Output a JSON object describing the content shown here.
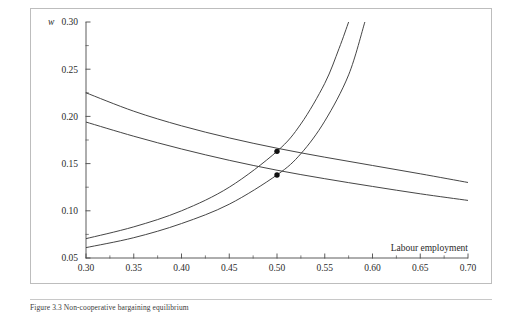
{
  "figure": {
    "caption": "Figure 3.3 Non-cooperative bargaining equilibrium",
    "y_axis_variable": "w",
    "x_axis_title": "Labour employment"
  },
  "chart_data": {
    "type": "line",
    "title": "",
    "xlabel": "Labour employment",
    "ylabel": "w",
    "xlim": [
      0.3,
      0.7
    ],
    "ylim": [
      0.05,
      0.3
    ],
    "xticks": [
      0.3,
      0.35,
      0.4,
      0.45,
      0.5,
      0.55,
      0.6,
      0.65,
      0.7
    ],
    "xtick_labels": [
      "0.30",
      "0.35",
      "0.40",
      "0.45",
      "0.50",
      "0.55",
      "0.60",
      "0.65",
      "0.70"
    ],
    "yticks": [
      0.05,
      0.1,
      0.15,
      0.2,
      0.25,
      0.3
    ],
    "ytick_labels": [
      "0.05",
      "0.10",
      "0.15",
      "0.20",
      "0.25",
      "0.30"
    ],
    "minor_xticks": [
      0.325,
      0.375,
      0.425,
      0.475,
      0.525,
      0.575,
      0.625,
      0.675
    ],
    "minor_yticks": [
      0.075,
      0.125,
      0.175,
      0.225,
      0.275
    ],
    "grid": false,
    "legend": "none",
    "line_color": "#3b3b3b",
    "series": [
      {
        "name": "demand-upper",
        "kind": "decreasing",
        "x": [
          0.3,
          0.35,
          0.4,
          0.45,
          0.5,
          0.55,
          0.6,
          0.65,
          0.7
        ],
        "values": [
          0.225,
          0.2055,
          0.19,
          0.1772,
          0.1663,
          0.1568,
          0.148,
          0.1392,
          0.13
        ]
      },
      {
        "name": "demand-lower",
        "kind": "decreasing",
        "x": [
          0.3,
          0.35,
          0.4,
          0.45,
          0.5,
          0.55,
          0.6,
          0.65,
          0.7
        ],
        "values": [
          0.194,
          0.179,
          0.1655,
          0.1535,
          0.143,
          0.134,
          0.1258,
          0.118,
          0.111
        ]
      },
      {
        "name": "supply-left",
        "kind": "increasing",
        "x": [
          0.3,
          0.35,
          0.4,
          0.45,
          0.5,
          0.525,
          0.55,
          0.565,
          0.575
        ],
        "values": [
          0.0705,
          0.083,
          0.1,
          0.125,
          0.163,
          0.192,
          0.235,
          0.272,
          0.3
        ]
      },
      {
        "name": "supply-right",
        "kind": "increasing",
        "x": [
          0.3,
          0.35,
          0.4,
          0.45,
          0.5,
          0.525,
          0.55,
          0.575,
          0.592
        ],
        "values": [
          0.061,
          0.0715,
          0.0865,
          0.107,
          0.138,
          0.1605,
          0.195,
          0.244,
          0.3
        ]
      }
    ],
    "points": [
      {
        "name": "equilibrium-upper",
        "x": 0.5,
        "y": 0.163,
        "marker": "filled-circle"
      },
      {
        "name": "equilibrium-lower",
        "x": 0.5,
        "y": 0.138,
        "marker": "filled-circle"
      }
    ]
  }
}
